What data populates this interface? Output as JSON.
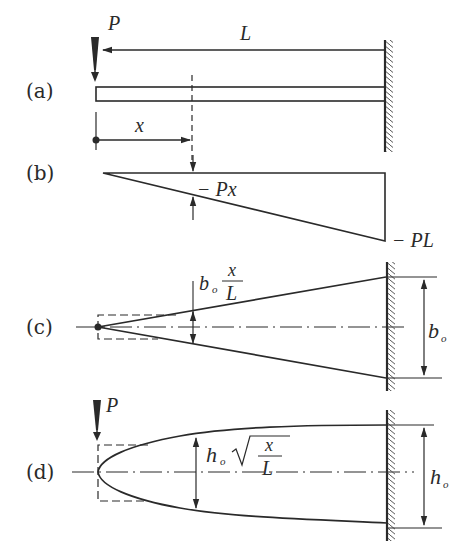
{
  "figure": {
    "panels": [
      {
        "id": "a",
        "label": "(a)",
        "load_label": "P",
        "length_label": "L",
        "position_label": "x",
        "description": "Cantilever beam of length L, fixed at right wall, point load P at free left end"
      },
      {
        "id": "b",
        "label": "(b)",
        "moment_at_x_label": "− Px",
        "moment_at_wall_label": "− PL",
        "description": "Bending moment diagram, linear from 0 at free end to −PL at wall"
      },
      {
        "id": "c",
        "label": "(c)",
        "width_at_x_num": "x",
        "width_at_x_den": "L",
        "width_prefix": "b",
        "width_prefix_sub": "o",
        "root_width_label": "b",
        "root_width_sub": "o",
        "description": "Plan view: linearly tapered width b_o·x/L (constant depth)"
      },
      {
        "id": "d",
        "label": "(d)",
        "load_label": "P",
        "depth_prefix": "h",
        "depth_prefix_sub": "o",
        "depth_num": "x",
        "depth_den": "L",
        "root_depth_label": "h",
        "root_depth_sub": "o",
        "description": "Elevation: parabolic depth h_o·sqrt(x/L) (constant width)"
      }
    ],
    "colors": {
      "ink": "#2a2a2a",
      "background": "#ffffff"
    }
  }
}
